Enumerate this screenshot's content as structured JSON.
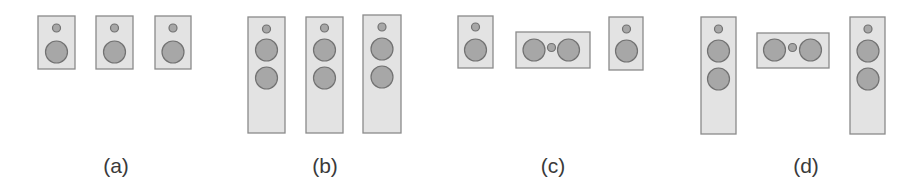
{
  "figure": {
    "colors": {
      "cabinet_fill": "#e3e3e3",
      "cabinet_stroke": "#8a8a8a",
      "driver_fill": "#a7a7a7",
      "driver_stroke": "#727272",
      "label_text": "#3a3a3a"
    },
    "panels": [
      {
        "label": "(a)",
        "label_x": 116,
        "description": "three bookshelf speakers",
        "speakers": [
          {
            "type": "bookshelf",
            "x": 38,
            "y": 16,
            "w": 37,
            "h": 53,
            "tweeters": [
              [
                56.5,
                28
              ]
            ],
            "woofers": [
              [
                56.5,
                52
              ]
            ]
          },
          {
            "type": "bookshelf",
            "x": 96,
            "y": 16,
            "w": 37,
            "h": 53,
            "tweeters": [
              [
                114.5,
                28
              ]
            ],
            "woofers": [
              [
                114.5,
                52
              ]
            ]
          },
          {
            "type": "bookshelf",
            "x": 155,
            "y": 16,
            "w": 36,
            "h": 53,
            "tweeters": [
              [
                173,
                28
              ]
            ],
            "woofers": [
              [
                173,
                52
              ]
            ]
          }
        ]
      },
      {
        "label": "(b)",
        "label_x": 325,
        "description": "three floor-standing speakers",
        "speakers": [
          {
            "type": "tower",
            "x": 248,
            "y": 17,
            "w": 37,
            "h": 116,
            "tweeters": [
              [
                266.5,
                29
              ]
            ],
            "woofers": [
              [
                266.5,
                50
              ],
              [
                266.5,
                78
              ]
            ]
          },
          {
            "type": "tower",
            "x": 306,
            "y": 17,
            "w": 37,
            "h": 116,
            "tweeters": [
              [
                324.5,
                28
              ]
            ],
            "woofers": [
              [
                324.5,
                50
              ],
              [
                324.5,
                78
              ]
            ]
          },
          {
            "type": "tower",
            "x": 363,
            "y": 15,
            "w": 38,
            "h": 118,
            "tweeters": [
              [
                382,
                27
              ]
            ],
            "woofers": [
              [
                382,
                49
              ],
              [
                382,
                77
              ]
            ]
          }
        ]
      },
      {
        "label": "(c)",
        "label_x": 553,
        "description": "two bookshelf speakers with center channel",
        "speakers": [
          {
            "type": "bookshelf",
            "x": 458,
            "y": 16,
            "w": 35,
            "h": 52,
            "tweeters": [
              [
                475.5,
                27
              ]
            ],
            "woofers": [
              [
                475.5,
                50
              ]
            ]
          },
          {
            "type": "center",
            "x": 516,
            "y": 32,
            "w": 74,
            "h": 36,
            "tweeters": [
              [
                551.5,
                47.5
              ]
            ],
            "woofers": [
              [
                534,
                50
              ],
              [
                568.5,
                50
              ]
            ]
          },
          {
            "type": "bookshelf",
            "x": 609,
            "y": 17,
            "w": 34,
            "h": 53,
            "tweeters": [
              [
                626.5,
                29
              ]
            ],
            "woofers": [
              [
                626.5,
                51
              ]
            ]
          }
        ]
      },
      {
        "label": "(d)",
        "label_x": 806,
        "description": "two floor-standing speakers with center channel",
        "speakers": [
          {
            "type": "tower",
            "x": 701,
            "y": 17,
            "w": 35,
            "h": 117,
            "tweeters": [
              [
                718.5,
                29
              ]
            ],
            "woofers": [
              [
                718.5,
                51
              ],
              [
                718.5,
                79
              ]
            ]
          },
          {
            "type": "center",
            "x": 757,
            "y": 33,
            "w": 72,
            "h": 35,
            "tweeters": [
              [
                792.5,
                47.5
              ]
            ],
            "woofers": [
              [
                774.5,
                50
              ],
              [
                810.5,
                50
              ]
            ]
          },
          {
            "type": "tower",
            "x": 850,
            "y": 17,
            "w": 35,
            "h": 117,
            "tweeters": [
              [
                868,
                29
              ]
            ],
            "woofers": [
              [
                868,
                51
              ],
              [
                868,
                79
              ]
            ]
          }
        ]
      }
    ],
    "driver_radius": {
      "tweeter": 4,
      "woofer": 11
    }
  }
}
